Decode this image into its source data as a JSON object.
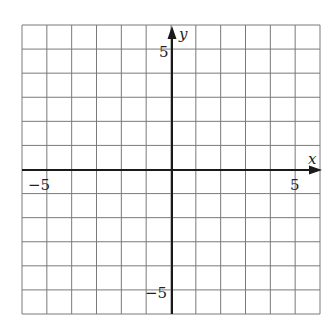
{
  "chart_data": {
    "type": "scatter",
    "title": "",
    "xlabel": "x",
    "ylabel": "y",
    "xlim": [
      -6,
      6
    ],
    "ylim": [
      -6,
      6
    ],
    "grid": true,
    "grid_step": 1,
    "x_tick_labels": [
      {
        "value": -5,
        "label": "−5"
      },
      {
        "value": 5,
        "label": "5"
      }
    ],
    "y_tick_labels": [
      {
        "value": 5,
        "label": "5"
      },
      {
        "value": -5,
        "label": "−5"
      }
    ],
    "series": [],
    "colors": {
      "grid": "#7a7a7a",
      "axis": "#1a1a1a",
      "background": "#ffffff"
    }
  },
  "labels": {
    "x_axis": "x",
    "y_axis": "y",
    "x_neg5": "−5",
    "x_pos5": "5",
    "y_pos5": "5",
    "y_neg5": "−5"
  }
}
